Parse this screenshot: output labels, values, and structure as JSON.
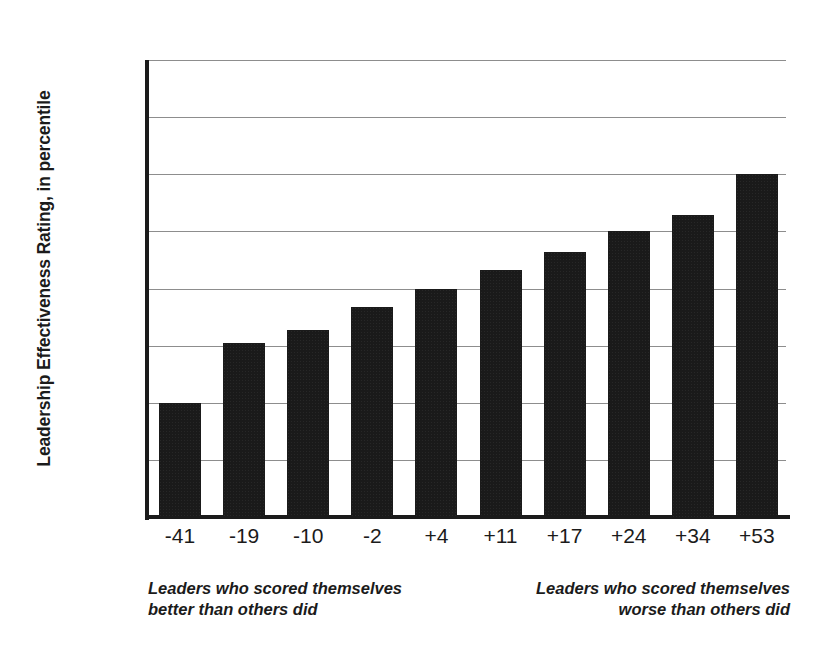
{
  "chart_data": {
    "type": "bar",
    "title": "",
    "xlabel": "",
    "ylabel": "Leadership Effectiveness Rating, in percentile",
    "categories": [
      "-41",
      "-19",
      "-10",
      "-2",
      "+4",
      "+11",
      "+17",
      "+24",
      "+34",
      "+53"
    ],
    "values": [
      25,
      38,
      41,
      46,
      50,
      54,
      58,
      62.5,
      66,
      75
    ],
    "ylim": [
      0,
      100
    ],
    "yticks": [
      0,
      12.5,
      25,
      37.5,
      50,
      62.5,
      75,
      87.5,
      100
    ],
    "ytick_labels": [
      "0",
      "",
      "25th",
      "",
      "50th",
      "",
      "75th",
      "",
      "100th"
    ],
    "grid": true,
    "legend": "none",
    "bar_color": "#1a1a1a",
    "gridline_color": "#8d8d8d",
    "axis_color": "#1b1b1b",
    "background_color": "#ffffff",
    "annotations": {
      "left_caption_line1": "Leaders who scored themselves",
      "left_caption_line2": "better than others did",
      "right_caption_line1": "Leaders who scored themselves",
      "right_caption_line2": "worse than others did"
    }
  },
  "axis": {
    "y_title": "Leadership Effectiveness Rating, in percentile"
  },
  "captions": {
    "left": "Leaders who scored themselves\nbetter than others did",
    "right": "Leaders who scored themselves\nworse than others did",
    "left_line1": "Leaders who scored themselves",
    "left_line2": "better than others did",
    "right_line1": "Leaders who scored themselves",
    "right_line2": "worse than others did"
  }
}
